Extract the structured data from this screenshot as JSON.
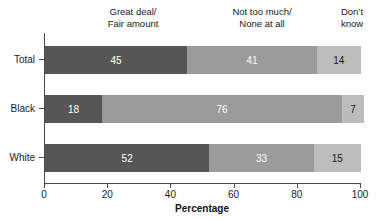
{
  "chart_data": {
    "type": "bar",
    "subtype": "horizontal-stacked-100",
    "title": "",
    "xlabel": "Percentage",
    "ylabel": "",
    "xlim": [
      0,
      100
    ],
    "xticks": [
      0,
      20,
      40,
      60,
      80,
      100
    ],
    "xtick_labels": [
      "0",
      "20",
      "40",
      "60",
      "80",
      "100"
    ],
    "grid": false,
    "legend_position": "top-inline-column-headers",
    "categories": [
      "Total",
      "Black",
      "White"
    ],
    "series": [
      {
        "name": "Great deal/Fair amount",
        "color": "#565656",
        "label_color": "#ffffff",
        "values": [
          45,
          18,
          52
        ]
      },
      {
        "name": "Not too much/None at all",
        "color": "#9b9b9b",
        "label_color": "#ffffff",
        "values": [
          41,
          76,
          33
        ]
      },
      {
        "name": "Don't know",
        "color": "#bcbcbc",
        "label_color": "#1a1a1a",
        "values": [
          14,
          7,
          15
        ]
      }
    ],
    "column_headers": [
      {
        "line1": "Great deal/",
        "line2": "Fair amount"
      },
      {
        "line1": "Not too much/",
        "line2": "None at all"
      },
      {
        "line1": "Don’t",
        "line2": "know"
      }
    ],
    "data_labels": {
      "Total": [
        45,
        41,
        14
      ],
      "Black": [
        18,
        76,
        7
      ],
      "White": [
        52,
        33,
        15
      ]
    }
  },
  "axis": {
    "x_title": "Percentage"
  }
}
